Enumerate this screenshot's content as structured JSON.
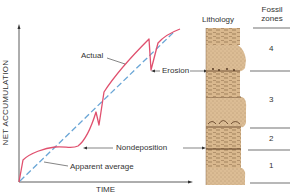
{
  "diagram": {
    "axes": {
      "x_label": "TIME",
      "y_label": "NET ACCUMULATION"
    },
    "curves": {
      "actual_label": "Actual",
      "average_label": "Apparent average",
      "actual_color": "#e0506e",
      "average_color": "#6aa6d6"
    },
    "annotations": {
      "erosion": "Erosion",
      "nondeposition": "Nondeposition"
    },
    "column": {
      "lithology_header": "Lithology",
      "fossil_header_line1": "Fossil",
      "fossil_header_line2": "zones",
      "sediment_color": "#d7b58c",
      "zones": [
        {
          "label": "4"
        },
        {
          "label": "3"
        },
        {
          "label": "2"
        },
        {
          "label": "1"
        }
      ]
    }
  }
}
